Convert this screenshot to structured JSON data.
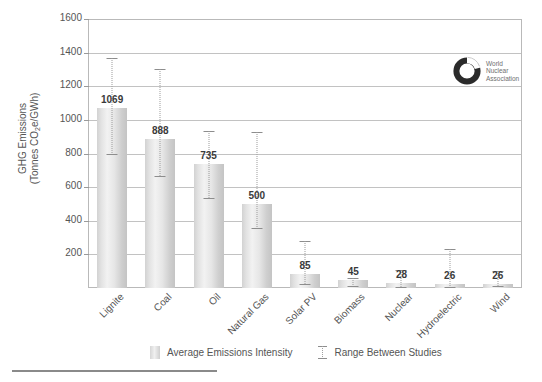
{
  "chart_data": {
    "type": "bar",
    "title": "",
    "xlabel": "",
    "ylabel_line1": "GHG Emissions",
    "ylabel_line2": "(Tonnes CO2e/GWh)",
    "ylim": [
      0,
      1600
    ],
    "ytick_step": 200,
    "yticks": [
      200,
      400,
      600,
      800,
      1000,
      1200,
      1400,
      1600
    ],
    "ytick_labels": [
      "200",
      "400",
      "600",
      "800",
      "1000",
      "1200",
      "1400",
      "1600"
    ],
    "grid": true,
    "legend_position": "bottom",
    "categories": [
      "Lignite",
      "Coal",
      "Oil",
      "Natural Gas",
      "Solar PV",
      "Biomass",
      "Nuclear",
      "Hydroelectric",
      "Wind"
    ],
    "values": [
      1069,
      888,
      735,
      500,
      85,
      45,
      28,
      26,
      26
    ],
    "value_labels": [
      "1069",
      "888",
      "735",
      "500",
      "85",
      "45",
      "28",
      "26",
      "26"
    ],
    "series": [
      {
        "name": "Average Emissions Intensity",
        "values": [
          1069,
          888,
          735,
          500,
          85,
          45,
          28,
          26,
          26
        ]
      },
      {
        "name": "Range Between Studies",
        "range_low": [
          790,
          660,
          530,
          350,
          15,
          8,
          2,
          2,
          4
        ],
        "range_high": [
          1370,
          1300,
          935,
          930,
          280,
          60,
          110,
          230,
          100
        ]
      }
    ],
    "legend": [
      "Average Emissions Intensity",
      "Range Between Studies"
    ],
    "colors": {
      "bar": "#e0e0e0",
      "bar_edge": "#c4c4c4",
      "grid": "#c2c2c2",
      "error_bar": "#9a9a9a",
      "text": "#555555"
    }
  },
  "logo": {
    "line1": "World",
    "line2": "Nuclear",
    "line3": "Association"
  }
}
